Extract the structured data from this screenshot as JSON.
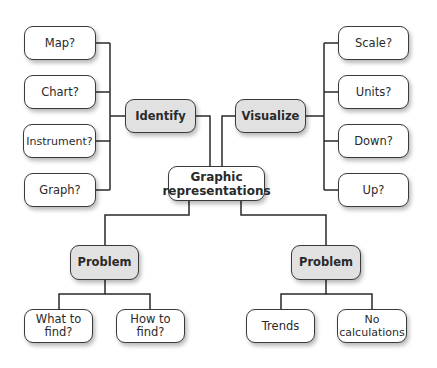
{
  "diagram": {
    "type": "concept-map",
    "root": {
      "label": "Graphic representations"
    },
    "branches": {
      "identify": {
        "label": "Identify",
        "children": [
          "Map?",
          "Chart?",
          "Instrument?",
          "Graph?"
        ]
      },
      "visualize": {
        "label": "Visualize",
        "children": [
          "Scale?",
          "Units?",
          "Down?",
          "Up?"
        ]
      },
      "problem_left": {
        "label": "Problem",
        "children": [
          "What to find?",
          "How to find?"
        ]
      },
      "problem_right": {
        "label": "Problem",
        "children": [
          "Trends",
          "No calculations"
        ]
      }
    },
    "colors": {
      "line": "#2a2a2a",
      "node_fill": "#ffffff",
      "category_fill": "#e1e1e1",
      "border": "#3a3a3a"
    }
  },
  "labels": {
    "root_line1": "Graphic",
    "root_line2": "representations",
    "identify": "Identify",
    "visualize": "Visualize",
    "problem_left": "Problem",
    "problem_right": "Problem",
    "map": "Map?",
    "chart": "Chart?",
    "instrument": "Instrument?",
    "graph": "Graph?",
    "scale": "Scale?",
    "units": "Units?",
    "down": "Down?",
    "up": "Up?",
    "what_line1": "What to",
    "what_line2": "find?",
    "how_line1": "How to",
    "how_line2": "find?",
    "trends": "Trends",
    "nocalc_line1": "No",
    "nocalc_line2": "calculations"
  }
}
